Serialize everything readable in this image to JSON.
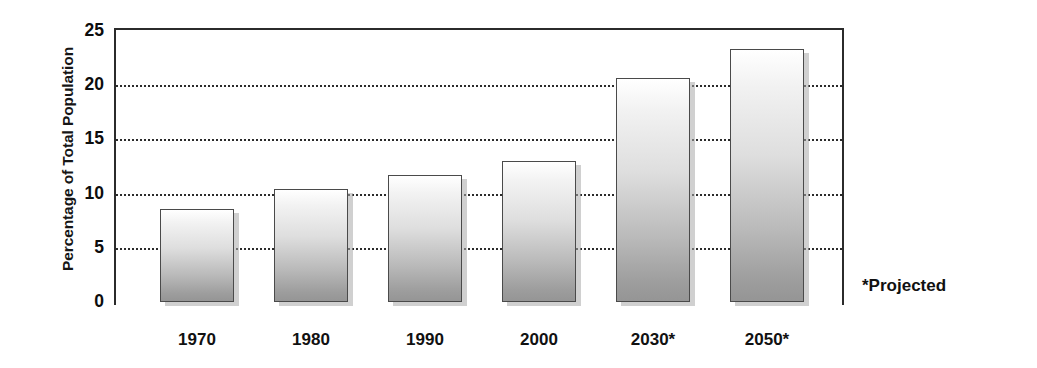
{
  "chart_data": {
    "type": "bar",
    "title": "",
    "subtitle": "",
    "xlabel": "",
    "ylabel": "Percentage of Total Population",
    "categories": [
      "1970",
      "1980",
      "1990",
      "2000",
      "2030*",
      "2050*"
    ],
    "values": [
      8.6,
      10.4,
      11.7,
      13.0,
      20.7,
      23.3
    ],
    "ylim": [
      0,
      25
    ],
    "yticks": [
      0,
      5,
      10,
      15,
      20,
      25
    ],
    "ytick_labels": [
      "0",
      "5",
      "10",
      "15",
      "20",
      "25"
    ],
    "gridlines": [
      5,
      10,
      15,
      20
    ],
    "grid": true,
    "legend": "none",
    "annotations": [
      "*Projected"
    ],
    "series": [
      {
        "name": "Percentage of Total Population",
        "values": [
          8.6,
          10.4,
          11.7,
          13.0,
          20.7,
          23.3
        ]
      }
    ]
  },
  "axis": {
    "y_title": "Percentage of Total Population",
    "y_tick_0": "0",
    "y_tick_1": "5",
    "y_tick_2": "10",
    "y_tick_3": "15",
    "y_tick_4": "20",
    "y_tick_5": "25"
  },
  "x_labels": {
    "b0": "1970",
    "b1": "1980",
    "b2": "1990",
    "b3": "2000",
    "b4": "2030*",
    "b5": "2050*"
  },
  "notes": {
    "projected": "*Projected"
  },
  "colors": {
    "bar_top": "#ffffff",
    "bar_bottom": "#959595",
    "bar_outline": "#4a4a4a",
    "bar_shadow": "#aaaaaa",
    "axis": "#2b2b2b",
    "text": "#111111",
    "background": "#ffffff"
  }
}
